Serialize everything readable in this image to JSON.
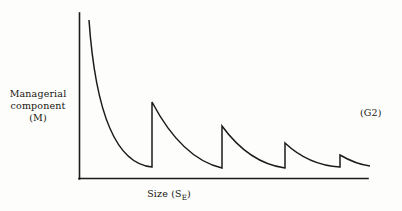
{
  "figure": {
    "panel_tag": "(G2)",
    "background_color": "#fdfdfc",
    "ink_color": "#1b1b1b"
  },
  "axes": {
    "y_label_lines": [
      "Managerial",
      "component",
      "(M)"
    ],
    "x_label_prefix": "Size  (S",
    "x_label_subscript": "E",
    "x_label_suffix": ")"
  },
  "chart_data": {
    "type": "line",
    "title": "",
    "xlabel": "Size (S_E)",
    "ylabel": "Managerial component (M)",
    "xlim": [
      0,
      100
    ],
    "ylim": [
      0,
      100
    ],
    "grid": false,
    "legend": null,
    "annotations": [
      {
        "text": "(G2)",
        "position": "right-middle"
      }
    ],
    "axis_geometry_px": {
      "y_axis_x": 79,
      "y_axis_top_y": 13,
      "origin_y": 179,
      "x_axis_right_x": 368
    },
    "series": [
      {
        "name": "Managerial component",
        "segments": [
          {
            "name": "segment-1",
            "start_px": [
              89,
              20
            ],
            "end_px": [
              152,
              167
            ],
            "control_px": [
              [
                96,
                120
              ],
              [
                118,
                164
              ]
            ]
          },
          {
            "name": "jump-1",
            "from_px": [
              152,
              167
            ],
            "to_px": [
              152,
              102
            ]
          },
          {
            "name": "segment-2",
            "start_px": [
              152,
              102
            ],
            "end_px": [
              222,
              168
            ],
            "control_px": [
              [
                172,
                140
              ],
              [
                196,
                162
              ]
            ]
          },
          {
            "name": "jump-2",
            "from_px": [
              222,
              168
            ],
            "to_px": [
              222,
              126
            ]
          },
          {
            "name": "segment-3",
            "start_px": [
              222,
              126
            ],
            "end_px": [
              285,
              168
            ],
            "control_px": [
              [
                241,
                152
              ],
              [
                263,
                165
              ]
            ]
          },
          {
            "name": "jump-3",
            "from_px": [
              285,
              168
            ],
            "to_px": [
              285,
              143
            ]
          },
          {
            "name": "segment-4",
            "start_px": [
              285,
              143
            ],
            "end_px": [
              340,
              167
            ],
            "control_px": [
              [
                302,
                159
              ],
              [
                322,
                166
              ]
            ]
          },
          {
            "name": "jump-4",
            "from_px": [
              340,
              167
            ],
            "to_px": [
              340,
              155
            ]
          },
          {
            "name": "segment-5",
            "start_px": [
              340,
              155
            ],
            "end_px": [
              370,
              166
            ],
            "control_px": [
              [
                352,
                162
              ],
              [
                362,
                165
              ]
            ]
          }
        ]
      }
    ]
  }
}
